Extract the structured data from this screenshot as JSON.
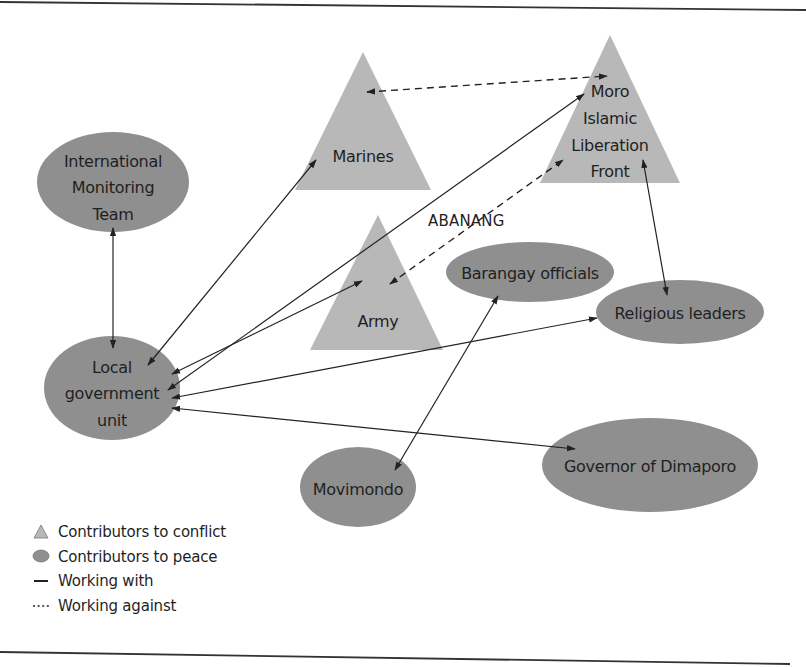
{
  "diagram": {
    "colors": {
      "conflict_fill": "#b8b8b8",
      "peace_fill": "#8f8f8f",
      "line": "#222222",
      "text": "#1f1f1f",
      "background": "#ffffff"
    },
    "nodes": {
      "marines": {
        "type": "conflict",
        "shape": "triangle",
        "label_lines": [
          "Marines"
        ]
      },
      "milf": {
        "type": "conflict",
        "shape": "triangle",
        "label_lines": [
          "Moro",
          "Islamic",
          "Liberation",
          "Front"
        ]
      },
      "army": {
        "type": "conflict",
        "shape": "triangle",
        "label_lines": [
          "Army"
        ]
      },
      "imt": {
        "type": "peace",
        "shape": "ellipse",
        "label_lines": [
          "International",
          "Monitoring",
          "Team"
        ]
      },
      "lgu": {
        "type": "peace",
        "shape": "ellipse",
        "label_lines": [
          "Local",
          "government",
          "unit"
        ]
      },
      "barangay": {
        "type": "peace",
        "shape": "ellipse",
        "label_lines": [
          "Barangay officials"
        ]
      },
      "religious": {
        "type": "peace",
        "shape": "ellipse",
        "label_lines": [
          "Religious leaders"
        ]
      },
      "movimondo": {
        "type": "peace",
        "shape": "ellipse",
        "label_lines": [
          "Movimondo"
        ]
      },
      "governor": {
        "type": "peace",
        "shape": "ellipse",
        "label_lines": [
          "Governor of Dimaporo"
        ]
      }
    },
    "free_labels": {
      "abanang": "ABANANG"
    },
    "edges": [
      {
        "from": "imt",
        "to": "lgu",
        "relation": "Working with",
        "style": "solid",
        "arrows": "both"
      },
      {
        "from": "lgu",
        "to": "marines",
        "relation": "Working with",
        "style": "solid",
        "arrows": "both"
      },
      {
        "from": "lgu",
        "to": "milf",
        "relation": "Working with",
        "style": "solid",
        "arrows": "both"
      },
      {
        "from": "lgu",
        "to": "army",
        "relation": "Working with",
        "style": "solid",
        "arrows": "both"
      },
      {
        "from": "lgu",
        "to": "religious",
        "relation": "Working with",
        "style": "solid",
        "arrows": "both"
      },
      {
        "from": "lgu",
        "to": "governor",
        "relation": "Working with",
        "style": "solid",
        "arrows": "both"
      },
      {
        "from": "barangay",
        "to": "movimondo",
        "relation": "Working with",
        "style": "solid",
        "arrows": "both"
      },
      {
        "from": "milf",
        "to": "religious",
        "relation": "Working with",
        "style": "solid",
        "arrows": "both"
      },
      {
        "from": "marines",
        "to": "milf",
        "relation": "Working against",
        "style": "dashed",
        "arrows": "both"
      },
      {
        "from": "army",
        "to": "milf",
        "relation": "Working against",
        "style": "dashed",
        "arrows": "both"
      }
    ],
    "legend": {
      "items": [
        {
          "symbol": "triangle",
          "label": "Contributors to conflict"
        },
        {
          "symbol": "ellipse",
          "label": "Contributors to peace"
        },
        {
          "symbol": "solid-line",
          "label": "Working with"
        },
        {
          "symbol": "dotted-line",
          "label": "Working against"
        }
      ]
    }
  }
}
